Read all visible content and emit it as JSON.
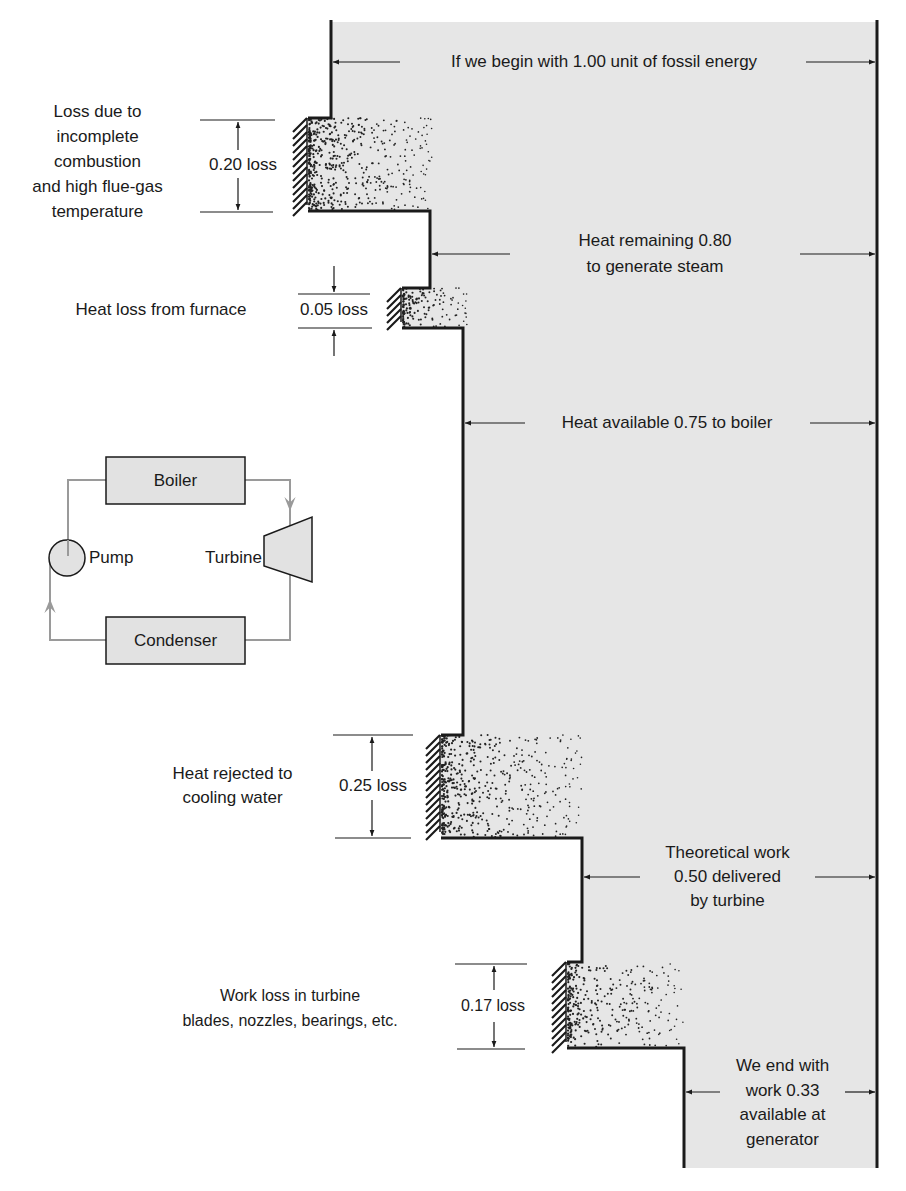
{
  "colors": {
    "fill": "#e6e6e6",
    "line": "#1a1a1a",
    "cycle_line": "#9a9a9a",
    "box_fill": "#e2e2e2"
  },
  "flows": {
    "input": "If we begin with 1.00 unit of fossil energy",
    "remaining_line1": "Heat remaining 0.80",
    "remaining_line2": "to generate steam",
    "available": "Heat available 0.75 to boiler",
    "theoretical_line1": "Theoretical work",
    "theoretical_line2": "0.50 delivered",
    "theoretical_line3": "by turbine",
    "end_line1": "We end with",
    "end_line2": "work 0.33",
    "end_line3": "available at",
    "end_line4": "generator"
  },
  "losses": [
    {
      "value": "0.20 loss",
      "desc": [
        "Loss due to",
        "incomplete",
        "combustion",
        "and high flue-gas",
        "temperature"
      ]
    },
    {
      "value": "0.05 loss",
      "desc": [
        "Heat loss from furnace"
      ]
    },
    {
      "value": "0.25 loss",
      "desc": [
        "Heat rejected to",
        "cooling water"
      ]
    },
    {
      "value": "0.17 loss",
      "desc": [
        "Work loss in turbine",
        "blades, nozzles, bearings, etc."
      ]
    }
  ],
  "cycle": {
    "boiler": "Boiler",
    "turbine": "Turbine",
    "pump": "Pump",
    "condenser": "Condenser"
  }
}
